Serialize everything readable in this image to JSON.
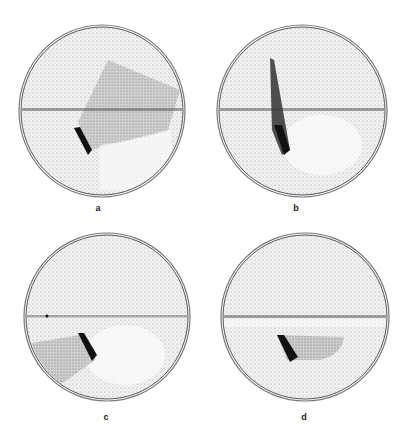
{
  "figure": {
    "panels": [
      {
        "id": "a",
        "label": "a",
        "description": "Petri dish with dark streak lower-left of center and a darker rotated rectangular shaded region extending up-right across the horizontal line"
      },
      {
        "id": "b",
        "label": "b",
        "description": "Petri dish with long dark tapered streak extending vertically across the horizontal line"
      },
      {
        "id": "c",
        "label": "c",
        "description": "Petri dish with dark streak and shaded region extending to lower-left"
      },
      {
        "id": "d",
        "label": "d",
        "description": "Petri dish with dark streak and shaded semicircular region extending right below the horizontal line"
      }
    ]
  }
}
